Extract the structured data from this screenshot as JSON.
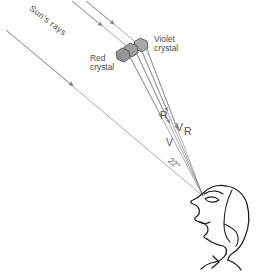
{
  "figure": {
    "labels": {
      "sun_rays": "Sun's rays",
      "red_crystal": "Red\ncrystal",
      "violet_crystal": "Violet\ncrystal",
      "ray_r_upper": "R",
      "ray_v_upper": "V",
      "ray_r_lower": "R",
      "ray_v_lower": "V",
      "halo_angle": "22°"
    },
    "colors": {
      "ray_line": "#8d8d8d",
      "ink": "#4a4a4a",
      "crystal_fill": "#a8a8a8",
      "crystal_stroke": "#5a5a5a",
      "background": "#ffffff"
    },
    "geometry": {
      "eye_point": "203,196",
      "crystal_cluster": "131,52",
      "halo_angle_degrees": 22,
      "incoming_ray_count": 3,
      "refracted_ray_count": 4
    },
    "icons": {
      "crystal": "hexagon-crystal-icon",
      "observer": "observer-head-profile-icon",
      "arrow": "ray-arrowhead-icon"
    }
  }
}
